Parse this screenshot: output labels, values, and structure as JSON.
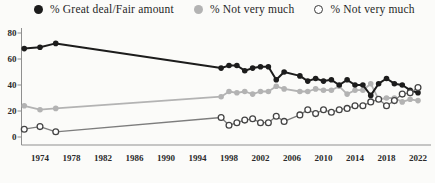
{
  "colors": {
    "background": "#fbfbf9",
    "series_black": "#1c1c1c",
    "series_gray": "#b3b3b3",
    "series_open_line": "#7d7d7d",
    "series_open_stroke": "#444444",
    "open_fill": "#ffffff",
    "axis": "#8f8f8f",
    "tick_text": "#2b2b2b"
  },
  "legend": {
    "items": [
      {
        "id": "great-deal-fair-amount",
        "label": "% Great deal/Fair amount"
      },
      {
        "id": "not-very-much",
        "label": "% Not very much"
      },
      {
        "id": "none-at-all",
        "label": "% Not very much"
      }
    ]
  },
  "chart_data": {
    "type": "line",
    "title": "",
    "xlabel": "",
    "ylabel": "",
    "x": [
      1972,
      1974,
      1976,
      1997,
      1998,
      1999,
      2000,
      2001,
      2002,
      2003,
      2004,
      2005,
      2007,
      2008,
      2009,
      2010,
      2011,
      2012,
      2013,
      2014,
      2015,
      2016,
      2017,
      2018,
      2019,
      2020,
      2021,
      2022
    ],
    "series": [
      {
        "id": "great-deal-fair-amount",
        "name": "% Great deal/Fair amount",
        "marker": "filled-black",
        "values": [
          68,
          69,
          72,
          53,
          55,
          55,
          51,
          53,
          54,
          54,
          44,
          50,
          47,
          43,
          45,
          43,
          44,
          40,
          44,
          40,
          40,
          32,
          41,
          45,
          41,
          40,
          36,
          34
        ]
      },
      {
        "id": "not-very-much",
        "name": "% Not very much",
        "marker": "filled-gray",
        "values": [
          24,
          21,
          22,
          31,
          35,
          34,
          35,
          33,
          35,
          35,
          39,
          37,
          35,
          35,
          37,
          36,
          36,
          39,
          33,
          36,
          36,
          41,
          29,
          30,
          30,
          27,
          29,
          28
        ]
      },
      {
        "id": "none-at-all",
        "name": "% Not very much",
        "marker": "open-circle",
        "values": [
          6,
          8,
          4,
          15,
          9,
          11,
          13,
          14,
          11,
          11,
          16,
          12,
          17,
          21,
          18,
          21,
          19,
          21,
          22,
          24,
          24,
          27,
          29,
          24,
          28,
          33,
          34,
          38
        ]
      }
    ],
    "xticks": [
      1974,
      1978,
      1982,
      1986,
      1990,
      1994,
      1998,
      2002,
      2006,
      2010,
      2014,
      2018,
      2022
    ],
    "yticks": [
      0,
      20,
      40,
      60,
      80
    ],
    "xlim": [
      1972,
      2023
    ],
    "ylim": [
      0,
      80
    ],
    "grid": false,
    "legend_position": "top"
  }
}
